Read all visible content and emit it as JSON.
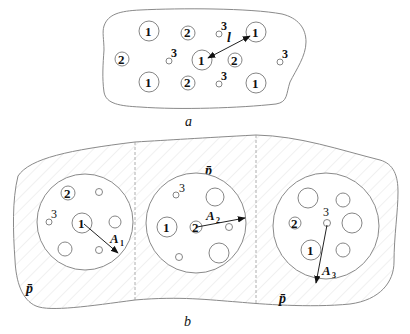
{
  "figure": {
    "panel_a": {
      "caption": "a",
      "distance_label": "l",
      "particles": [
        {
          "type": "1",
          "x": 140,
          "y": 31,
          "r": 10
        },
        {
          "type": "2",
          "x": 188,
          "y": 33,
          "r": 7
        },
        {
          "type": "3",
          "x": 218,
          "y": 32,
          "r": 3
        },
        {
          "type": "1",
          "x": 256,
          "y": 31,
          "r": 10
        },
        {
          "type": "2",
          "x": 122,
          "y": 59,
          "r": 7
        },
        {
          "type": "3",
          "x": 168,
          "y": 60,
          "r": 3
        },
        {
          "type": "1",
          "x": 202,
          "y": 59,
          "r": 10
        },
        {
          "type": "2",
          "x": 234,
          "y": 60,
          "r": 7
        },
        {
          "type": "3",
          "x": 281,
          "y": 60,
          "r": 3
        },
        {
          "type": "1",
          "x": 146,
          "y": 82,
          "r": 10
        },
        {
          "type": "2",
          "x": 187,
          "y": 82,
          "r": 7
        },
        {
          "type": "3",
          "x": 218,
          "y": 84,
          "r": 3
        },
        {
          "type": "1",
          "x": 256,
          "y": 82,
          "r": 10
        }
      ]
    },
    "panel_b": {
      "caption": "b",
      "matrix_label": "p̄",
      "cells": [
        {
          "center_label": "1",
          "arrow_label": "A",
          "arrow_sub": "1",
          "inner_labels": [
            "2",
            "3"
          ]
        },
        {
          "center_label": "2",
          "arrow_label": "A",
          "arrow_sub": "2",
          "inner_labels": [
            "1",
            "3"
          ]
        },
        {
          "center_label": "3",
          "arrow_label": "A",
          "arrow_sub": "3",
          "inner_labels": [
            "2",
            "1"
          ]
        }
      ]
    },
    "colors": {
      "line": "#8a8a8a",
      "text": "#111111",
      "hatch": "#e4e4e4"
    }
  }
}
